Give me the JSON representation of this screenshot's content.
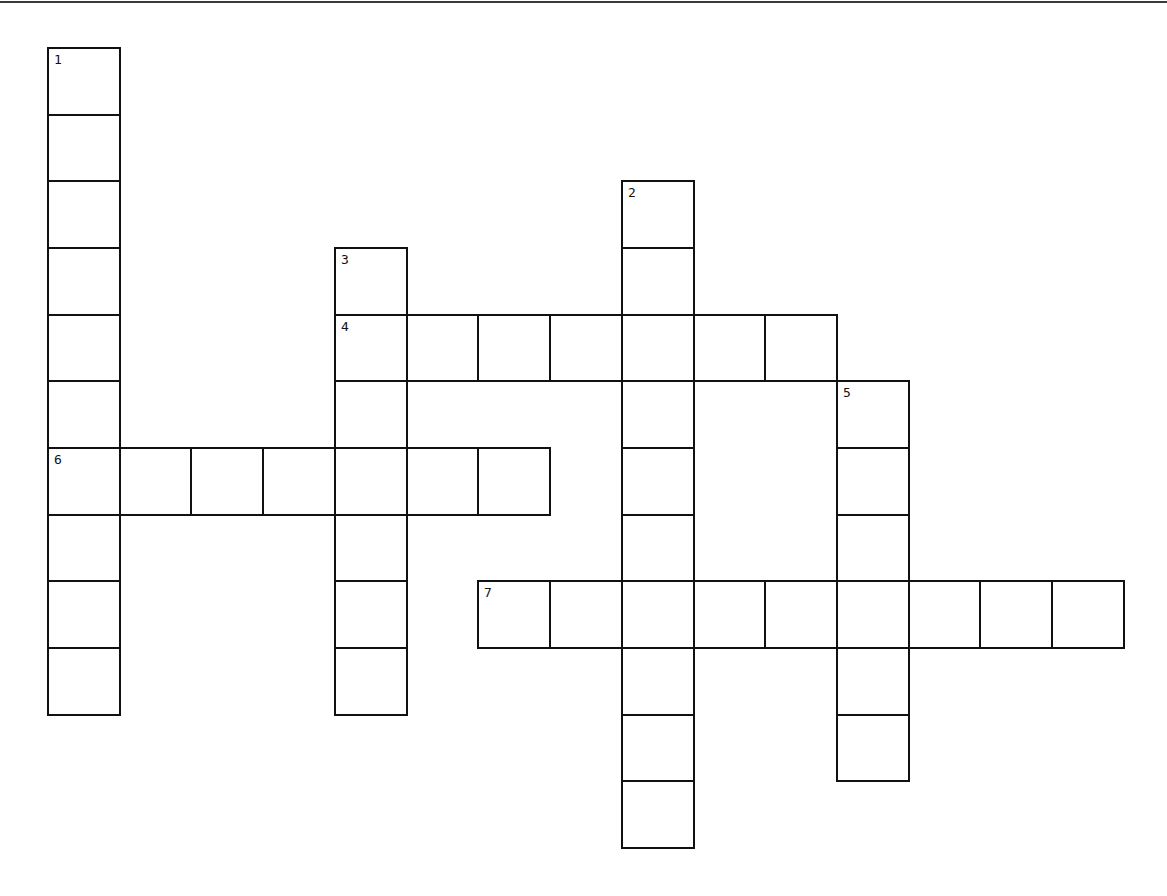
{
  "puzzle": {
    "type": "crossword",
    "grid": {
      "origin_x": 48,
      "origin_y": 48,
      "cell_width": 71.73,
      "cell_height": 66.67,
      "columns": 15,
      "rows": 12
    },
    "colors": {
      "background": "#ffffff",
      "line": "#111111",
      "top_rule": "#3a3a3a"
    },
    "words": [
      {
        "number": "1",
        "direction": "down",
        "row": 0,
        "col": 0,
        "length": 10
      },
      {
        "number": "2",
        "direction": "down",
        "row": 2,
        "col": 8,
        "length": 10
      },
      {
        "number": "3",
        "direction": "down",
        "row": 3,
        "col": 4,
        "length": 7
      },
      {
        "number": "4",
        "direction": "across",
        "row": 4,
        "col": 4,
        "length": 7
      },
      {
        "number": "5",
        "direction": "down",
        "row": 5,
        "col": 11,
        "length": 6
      },
      {
        "number": "6",
        "direction": "across",
        "row": 6,
        "col": 0,
        "length": 7
      },
      {
        "number": "7",
        "direction": "across",
        "row": 8,
        "col": 6,
        "length": 9
      }
    ]
  }
}
